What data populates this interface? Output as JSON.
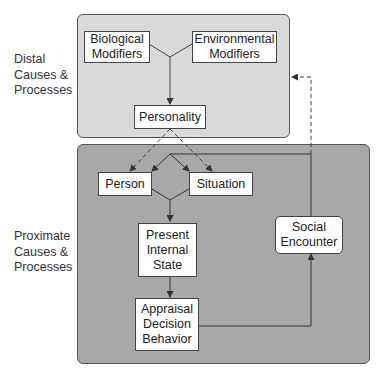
{
  "regions": {
    "distal": {
      "label": "Distal\nCauses &\nProcesses",
      "fill": "#d9d9d9"
    },
    "proximate": {
      "label": "Proximate\nCauses &\nProcesses",
      "fill": "#a8a8a8"
    }
  },
  "nodes": {
    "biological": "Biological\nModifiers",
    "environmental": "Environmental\nModifiers",
    "personality": "Personality",
    "person": "Person",
    "situation": "Situation",
    "present_state": "Present\nInternal\nState",
    "appraisal": "Appraisal\nDecision\nBehavior",
    "social_encounter": "Social\nEncounter"
  },
  "edges": [
    {
      "from": "biological",
      "to": "personality",
      "style": "solid"
    },
    {
      "from": "environmental",
      "to": "personality",
      "style": "solid"
    },
    {
      "from": "personality",
      "to": "person",
      "style": "dashed"
    },
    {
      "from": "personality",
      "to": "situation",
      "style": "dashed"
    },
    {
      "from": "person",
      "to": "present_state",
      "style": "solid"
    },
    {
      "from": "situation",
      "to": "present_state",
      "style": "solid"
    },
    {
      "from": "present_state",
      "to": "appraisal",
      "style": "solid"
    },
    {
      "from": "appraisal",
      "to": "social_encounter",
      "style": "solid"
    },
    {
      "from": "social_encounter",
      "to": "person",
      "style": "solid"
    },
    {
      "from": "social_encounter",
      "to": "situation",
      "style": "solid"
    },
    {
      "from": "social_encounter",
      "to": "distal_region",
      "style": "dashed"
    }
  ]
}
